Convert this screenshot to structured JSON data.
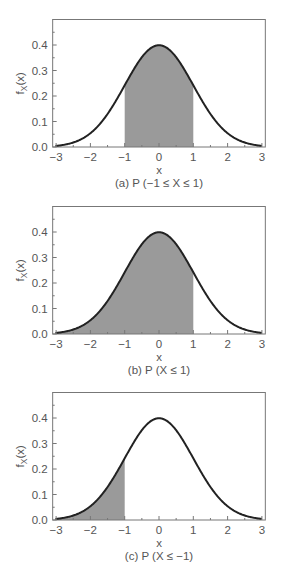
{
  "chart_data": [
    {
      "type": "area",
      "title": "(a) P (−1 ≤ X ≤ 1)",
      "caption": "(a) P (−1 ≤ X ≤ 1)",
      "xlabel": "x",
      "ylabel": "f_X(x)",
      "ylabel_main": "f",
      "ylabel_sub": "X",
      "ylabel_tail": "(x)",
      "xlim": [
        -3.1,
        3.1
      ],
      "ylim": [
        0,
        0.5
      ],
      "xticks": [
        -3,
        -2,
        -1,
        0,
        1,
        2,
        3
      ],
      "xtick_labels": [
        "−3",
        "−2",
        "−1",
        "0",
        "1",
        "2",
        "3"
      ],
      "yticks": [
        0.0,
        0.1,
        0.2,
        0.3,
        0.4
      ],
      "ytick_labels": [
        "0.0",
        "0.1",
        "0.2",
        "0.3",
        "0.4"
      ],
      "grid": false,
      "curve": "standard normal pdf",
      "mean": 0,
      "std": 1,
      "shaded_region": [
        -1,
        1
      ],
      "x": [
        -3,
        -2.5,
        -2,
        -1.5,
        -1,
        -0.5,
        0,
        0.5,
        1,
        1.5,
        2,
        2.5,
        3
      ],
      "values": [
        0.0044,
        0.0175,
        0.054,
        0.1295,
        0.242,
        0.3521,
        0.3989,
        0.3521,
        0.242,
        0.1295,
        0.054,
        0.0175,
        0.0044
      ]
    },
    {
      "type": "area",
      "title": "(b) P (X ≤ 1)",
      "caption": "(b) P (X ≤ 1)",
      "xlabel": "x",
      "ylabel": "f_X(x)",
      "ylabel_main": "f",
      "ylabel_sub": "X",
      "ylabel_tail": "(x)",
      "xlim": [
        -3.1,
        3.1
      ],
      "ylim": [
        0,
        0.5
      ],
      "xticks": [
        -3,
        -2,
        -1,
        0,
        1,
        2,
        3
      ],
      "xtick_labels": [
        "−3",
        "−2",
        "−1",
        "0",
        "1",
        "2",
        "3"
      ],
      "yticks": [
        0.0,
        0.1,
        0.2,
        0.3,
        0.4
      ],
      "ytick_labels": [
        "0.0",
        "0.1",
        "0.2",
        "0.3",
        "0.4"
      ],
      "grid": false,
      "curve": "standard normal pdf",
      "mean": 0,
      "std": 1,
      "shaded_region": [
        -3,
        1
      ],
      "x": [
        -3,
        -2.5,
        -2,
        -1.5,
        -1,
        -0.5,
        0,
        0.5,
        1,
        1.5,
        2,
        2.5,
        3
      ],
      "values": [
        0.0044,
        0.0175,
        0.054,
        0.1295,
        0.242,
        0.3521,
        0.3989,
        0.3521,
        0.242,
        0.1295,
        0.054,
        0.0175,
        0.0044
      ]
    },
    {
      "type": "area",
      "title": "(c) P (X ≤ −1)",
      "caption": "(c) P (X ≤ −1)",
      "xlabel": "x",
      "ylabel": "f_X(x)",
      "ylabel_main": "f",
      "ylabel_sub": "X",
      "ylabel_tail": "(x)",
      "xlim": [
        -3.1,
        3.1
      ],
      "ylim": [
        0,
        0.5
      ],
      "xticks": [
        -3,
        -2,
        -1,
        0,
        1,
        2,
        3
      ],
      "xtick_labels": [
        "−3",
        "−2",
        "−1",
        "0",
        "1",
        "2",
        "3"
      ],
      "yticks": [
        0.0,
        0.1,
        0.2,
        0.3,
        0.4
      ],
      "ytick_labels": [
        "0.0",
        "0.1",
        "0.2",
        "0.3",
        "0.4"
      ],
      "grid": false,
      "curve": "standard normal pdf",
      "mean": 0,
      "std": 1,
      "shaded_region": [
        -3,
        -1
      ],
      "x": [
        -3,
        -2.5,
        -2,
        -1.5,
        -1,
        -0.5,
        0,
        0.5,
        1,
        1.5,
        2,
        2.5,
        3
      ],
      "values": [
        0.0044,
        0.0175,
        0.054,
        0.1295,
        0.242,
        0.3521,
        0.3989,
        0.3521,
        0.242,
        0.1295,
        0.054,
        0.0175,
        0.0044
      ]
    }
  ],
  "style": {
    "frame_color": "#777777",
    "curve_color": "#222222",
    "shade_color": "#9a9a9a",
    "text_color": "#555555"
  }
}
